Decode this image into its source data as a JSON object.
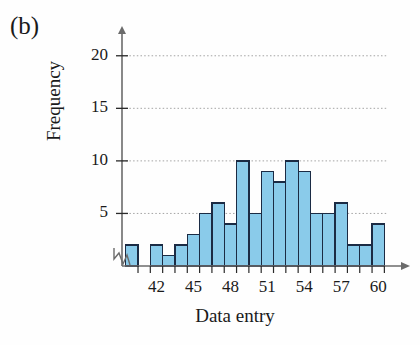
{
  "panel": {
    "label": "(b)"
  },
  "chart_data": {
    "type": "bar",
    "title": "",
    "xlabel": "Data entry",
    "ylabel": "Frequency",
    "categories": [
      40,
      41,
      42,
      43,
      44,
      45,
      46,
      47,
      48,
      49,
      50,
      51,
      52,
      53,
      54,
      55,
      56,
      57,
      58,
      59,
      60
    ],
    "values": [
      2,
      0,
      2,
      1,
      2,
      3,
      5,
      6,
      4,
      10,
      5,
      9,
      8,
      10,
      9,
      5,
      5,
      6,
      2,
      2,
      4
    ],
    "xlim": [
      39.2,
      61.2
    ],
    "ylim": [
      0,
      21.5
    ],
    "xticks": [
      42,
      45,
      48,
      51,
      54,
      57,
      60
    ],
    "xtick_labels": [
      "42",
      "45",
      "48",
      "51",
      "54",
      "57",
      "60"
    ],
    "yticks": [
      5,
      10,
      15,
      20
    ],
    "ytick_labels": [
      "5",
      "10",
      "15",
      "20"
    ],
    "minor_xticks_every": 1,
    "grid": "horizontal-dotted",
    "axis_break_symbol": true,
    "bar_fill": "#8ACBEA",
    "bar_edge": "#1b2b44",
    "grid_color": "#9a9a9a",
    "axis_color": "#6b6b6b",
    "legend": null
  }
}
